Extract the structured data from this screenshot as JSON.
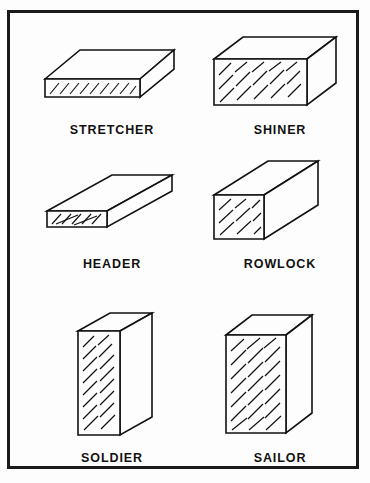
{
  "figure": {
    "background_color": "#fdfdfd",
    "border_color": "#1a1a1a",
    "line_color": "#111111",
    "border_width_px": 3,
    "columns": 2,
    "rows": 3
  },
  "bricks": [
    {
      "id": "stretcher",
      "label": "STRETCHER",
      "row": 1,
      "column": 1,
      "orientation": "laid flat, long face outward",
      "exposed_face": "stretcher face (long side)",
      "hatched_face": "front long face",
      "hatched_face_shape": "wide short rectangle"
    },
    {
      "id": "shiner",
      "label": "SHINER",
      "row": 1,
      "column": 2,
      "orientation": "laid flat, broad bed face outward",
      "exposed_face": "bed face (largest face)",
      "hatched_face": "front broad face",
      "hatched_face_shape": "wide tall rectangle"
    },
    {
      "id": "header",
      "label": "HEADER",
      "row": 2,
      "column": 1,
      "orientation": "laid flat, end outward, receding to upper right",
      "exposed_face": "header end (short end)",
      "hatched_face": "front end face",
      "hatched_face_shape": "small wide rectangle"
    },
    {
      "id": "rowlock",
      "label": "ROWLOCK",
      "row": 2,
      "column": 2,
      "orientation": "laid on edge, end outward, receding to upper right",
      "exposed_face": "end face on edge",
      "hatched_face": "front end face",
      "hatched_face_shape": "narrow tall rectangle"
    },
    {
      "id": "soldier",
      "label": "SOLDIER",
      "row": 3,
      "column": 1,
      "orientation": "standing upright on end, narrow face outward",
      "exposed_face": "narrow long face, vertical",
      "hatched_face": "front narrow face",
      "hatched_face_shape": "narrow tall rectangle"
    },
    {
      "id": "sailor",
      "label": "SAILOR",
      "row": 3,
      "column": 2,
      "orientation": "standing upright on end, broad face outward",
      "exposed_face": "broad bed face, vertical",
      "hatched_face": "front broad face",
      "hatched_face_shape": "wide tall rectangle"
    }
  ]
}
